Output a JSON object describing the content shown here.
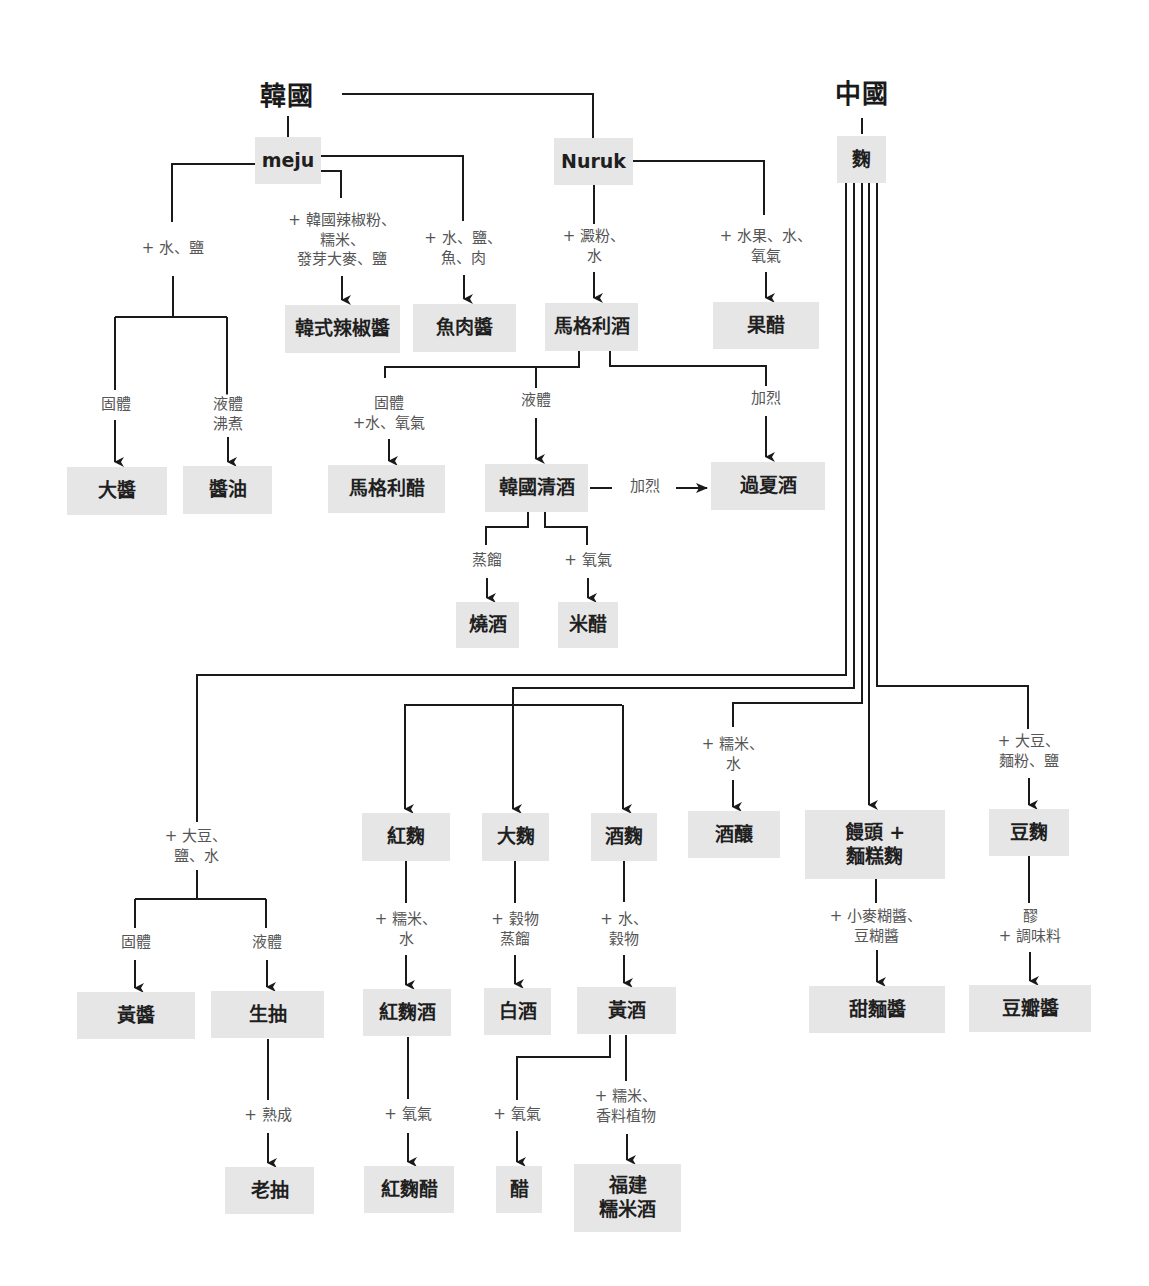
{
  "diagram": {
    "colors": {
      "box": "#e6e6e6",
      "line": "#1a1a1a",
      "label": "#555555",
      "text": "#1f1f1f"
    },
    "titles": [
      {
        "id": "korea",
        "text": "韓國",
        "x": 287,
        "y": 93
      },
      {
        "id": "china",
        "text": "中國",
        "x": 862,
        "y": 91
      }
    ],
    "nodes": [
      {
        "id": "meju",
        "text": "meju",
        "x": 255,
        "y": 137,
        "w": 66,
        "h": 47,
        "latin": true
      },
      {
        "id": "nuruk",
        "text": "Nuruk",
        "x": 554,
        "y": 138,
        "w": 79,
        "h": 47,
        "latin": true
      },
      {
        "id": "qu",
        "text": "麴",
        "x": 837,
        "y": 136,
        "w": 49,
        "h": 47
      },
      {
        "id": "gochujang",
        "text": "韓式辣椒醬",
        "x": 285,
        "y": 305,
        "w": 115,
        "h": 48
      },
      {
        "id": "fish_sauce",
        "text": "魚肉醬",
        "x": 413,
        "y": 304,
        "w": 103,
        "h": 48
      },
      {
        "id": "makgeolli",
        "text": "馬格利酒",
        "x": 545,
        "y": 303,
        "w": 93,
        "h": 48
      },
      {
        "id": "fruit_vinegar",
        "text": "果醋",
        "x": 713,
        "y": 302,
        "w": 106,
        "h": 47
      },
      {
        "id": "doenjang",
        "text": "大醬",
        "x": 67,
        "y": 467,
        "w": 100,
        "h": 48
      },
      {
        "id": "soy_sauce",
        "text": "醬油",
        "x": 183,
        "y": 466,
        "w": 89,
        "h": 48
      },
      {
        "id": "makgeolli_vinegar",
        "text": "馬格利醋",
        "x": 328,
        "y": 465,
        "w": 117,
        "h": 48
      },
      {
        "id": "cheongju",
        "text": "韓國清酒",
        "x": 485,
        "y": 464,
        "w": 103,
        "h": 48
      },
      {
        "id": "gwahaju",
        "text": "過夏酒",
        "x": 711,
        "y": 462,
        "w": 114,
        "h": 48
      },
      {
        "id": "soju",
        "text": "燒酒",
        "x": 456,
        "y": 602,
        "w": 63,
        "h": 46
      },
      {
        "id": "rice_vinegar",
        "text": "米醋",
        "x": 558,
        "y": 602,
        "w": 60,
        "h": 46
      },
      {
        "id": "hongqu",
        "text": "紅麴",
        "x": 362,
        "y": 813,
        "w": 88,
        "h": 48
      },
      {
        "id": "daqu",
        "text": "大麴",
        "x": 482,
        "y": 813,
        "w": 67,
        "h": 48
      },
      {
        "id": "jiuqu",
        "text": "酒麴",
        "x": 591,
        "y": 813,
        "w": 66,
        "h": 48
      },
      {
        "id": "jiuniang",
        "text": "酒釀",
        "x": 688,
        "y": 811,
        "w": 92,
        "h": 47
      },
      {
        "id": "mantou_qu",
        "text": "饅頭 +\n麵糕麴",
        "x": 805,
        "y": 810,
        "w": 140,
        "h": 69
      },
      {
        "id": "douqu",
        "text": "豆麴",
        "x": 989,
        "y": 809,
        "w": 80,
        "h": 47
      },
      {
        "id": "huangjiang",
        "text": "黃醬",
        "x": 77,
        "y": 992,
        "w": 118,
        "h": 47
      },
      {
        "id": "shengchou",
        "text": "生抽",
        "x": 211,
        "y": 991,
        "w": 113,
        "h": 47
      },
      {
        "id": "hongqu_jiu",
        "text": "紅麴酒",
        "x": 363,
        "y": 989,
        "w": 88,
        "h": 47
      },
      {
        "id": "baijiu",
        "text": "白酒",
        "x": 484,
        "y": 988,
        "w": 67,
        "h": 47
      },
      {
        "id": "huangjiu",
        "text": "黃酒",
        "x": 577,
        "y": 987,
        "w": 99,
        "h": 47
      },
      {
        "id": "tianmianjiang",
        "text": "甜麵醬",
        "x": 809,
        "y": 986,
        "w": 136,
        "h": 47
      },
      {
        "id": "doubanjiang",
        "text": "豆瓣醬",
        "x": 969,
        "y": 985,
        "w": 122,
        "h": 47
      },
      {
        "id": "laochou",
        "text": "老抽",
        "x": 225,
        "y": 1167,
        "w": 89,
        "h": 47
      },
      {
        "id": "hongqu_vinegar",
        "text": "紅麴醋",
        "x": 364,
        "y": 1166,
        "w": 90,
        "h": 47
      },
      {
        "id": "cu",
        "text": "醋",
        "x": 496,
        "y": 1166,
        "w": 46,
        "h": 47
      },
      {
        "id": "fujian_rice_wine",
        "text": "福建\n糯米酒",
        "x": 574,
        "y": 1164,
        "w": 107,
        "h": 68
      }
    ],
    "labels": [
      {
        "id": "l_water_salt",
        "text": "+ 水、鹽",
        "x": 173,
        "y": 249
      },
      {
        "id": "l_gochujang",
        "text": "+ 韓國辣椒粉、\n糯米、\n發芽大麥、鹽",
        "x": 342,
        "y": 240
      },
      {
        "id": "l_fish",
        "text": "+ 水、鹽、\n魚、肉",
        "x": 463,
        "y": 248
      },
      {
        "id": "l_starch",
        "text": "+ 澱粉、\n水",
        "x": 594,
        "y": 246
      },
      {
        "id": "l_fruit",
        "text": "+ 水果、水、\n氧氣",
        "x": 766,
        "y": 246
      },
      {
        "id": "l_solid1",
        "text": "固體",
        "x": 116,
        "y": 405
      },
      {
        "id": "l_liquid_boil",
        "text": "液體\n沸煮",
        "x": 228,
        "y": 414
      },
      {
        "id": "l_solid_water_o2",
        "text": "固體\n+水、氧氣",
        "x": 389,
        "y": 413
      },
      {
        "id": "l_liquid1",
        "text": "液體",
        "x": 536,
        "y": 401
      },
      {
        "id": "l_fortify1",
        "text": "加烈",
        "x": 766,
        "y": 399
      },
      {
        "id": "l_fortify2",
        "text": "加烈",
        "x": 645,
        "y": 487
      },
      {
        "id": "l_distill1",
        "text": "蒸餾",
        "x": 487,
        "y": 561
      },
      {
        "id": "l_oxygen1",
        "text": "+ 氧氣",
        "x": 588,
        "y": 561
      },
      {
        "id": "l_soy_salt_water",
        "text": "+ 大豆、\n鹽、水",
        "x": 196,
        "y": 846
      },
      {
        "id": "l_glutinous_water1",
        "text": "+ 糯米、\n水",
        "x": 733,
        "y": 754
      },
      {
        "id": "l_soy_flour_salt",
        "text": "+ 大豆、\n麵粉、鹽",
        "x": 1029,
        "y": 751
      },
      {
        "id": "l_glutinous_water2",
        "text": "+ 糯米、\n水",
        "x": 406,
        "y": 929
      },
      {
        "id": "l_grain_distill",
        "text": "+ 穀物\n蒸餾",
        "x": 515,
        "y": 929
      },
      {
        "id": "l_water_grain",
        "text": "+ 水、\n穀物",
        "x": 624,
        "y": 929
      },
      {
        "id": "l_wheat_bean_paste",
        "text": "+ 小麥糊醬、\n豆糊醬",
        "x": 876,
        "y": 926
      },
      {
        "id": "l_mash_seasoning",
        "text": "醪\n+ 調味料",
        "x": 1030,
        "y": 926
      },
      {
        "id": "l_solid2",
        "text": "固體",
        "x": 136,
        "y": 943
      },
      {
        "id": "l_liquid2",
        "text": "液體",
        "x": 267,
        "y": 943
      },
      {
        "id": "l_aging",
        "text": "+ 熟成",
        "x": 268,
        "y": 1116
      },
      {
        "id": "l_oxygen2",
        "text": "+ 氧氣",
        "x": 408,
        "y": 1115
      },
      {
        "id": "l_oxygen3",
        "text": "+ 氧氣",
        "x": 517,
        "y": 1115
      },
      {
        "id": "l_glutinous_spice",
        "text": "+ 糯米、\n香料植物",
        "x": 626,
        "y": 1106
      }
    ]
  }
}
